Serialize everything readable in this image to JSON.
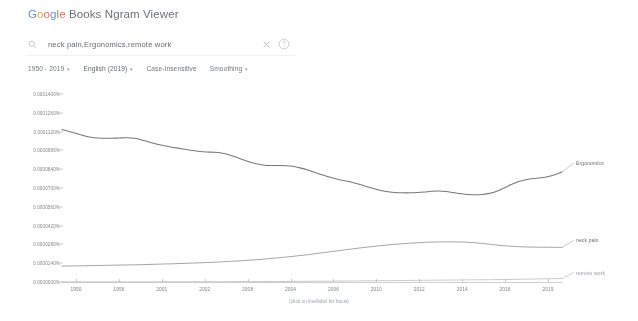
{
  "app": {
    "brand_parts": [
      "G",
      "o",
      "o",
      "g",
      "l",
      "e"
    ],
    "title_rest": " Books Ngram Viewer"
  },
  "search": {
    "value": "neck pain,Ergonomics,remote work",
    "placeholder": "Search in Google Books",
    "search_icon": "search-icon",
    "clear_icon": "close-icon",
    "help_icon": "help-circle-icon"
  },
  "controls": {
    "year_range": "1950 - 2019",
    "corpus": "English (2019)",
    "case_insensitive": "Case-Insensitive",
    "smoothing": "Smoothing",
    "caret": "▾"
  },
  "chart_data": {
    "type": "line",
    "title": "",
    "xlabel": "",
    "ylabel": "",
    "caption": "(click on line/label for focus)",
    "grid": false,
    "legend_position": "right-inline",
    "xlim": [
      1950,
      2019
    ],
    "ylim": [
      0.0,
      0.00014
    ],
    "ytick_labels": [
      "0.0001400%",
      "0.0001260%",
      "0.0001120%",
      "0.0000980%",
      "0.0000840%",
      "0.0000700%",
      "0.0000560%",
      "0.0000420%",
      "0.0000280%",
      "0.0000140%",
      "0.0000000%"
    ],
    "ytick_values": [
      0.00014,
      0.000126,
      0.000112,
      9.8e-05,
      8.4e-05,
      7e-05,
      5.6e-05,
      4.2e-05,
      2.8e-05,
      1.4e-05,
      0.0
    ],
    "xtick_labels": [
      "1950",
      "1956",
      "2001",
      "2002",
      "2008",
      "2004",
      "2006",
      "2010",
      "2012",
      "2014",
      "2016",
      "2019"
    ],
    "xtick_years": [
      1950,
      1956,
      2001,
      2002,
      2008,
      2004,
      2006,
      2010,
      2012,
      2014,
      2016,
      2019
    ],
    "series": [
      {
        "name": "Ergonomics",
        "color": "#5f6368",
        "label_x": 2019,
        "values": [
          0.0001135,
          0.000112,
          0.0001105,
          0.000109,
          0.0001078,
          0.0001072,
          0.000107,
          0.0001071,
          0.0001073,
          0.0001074,
          0.000107,
          0.0001058,
          0.0001042,
          0.0001028,
          0.0001016,
          0.0001006,
          9.97e-05,
          9.88e-05,
          9.79e-05,
          9.72e-05,
          9.68e-05,
          9.66e-05,
          9.6e-05,
          9.48e-05,
          9.3e-05,
          9.1e-05,
          8.92e-05,
          8.78e-05,
          8.7e-05,
          8.68e-05,
          8.68e-05,
          8.66e-05,
          8.6e-05,
          8.48e-05,
          8.32e-05,
          8.14e-05,
          7.96e-05,
          7.8e-05,
          7.66e-05,
          7.54e-05,
          7.42e-05,
          7.28e-05,
          7.12e-05,
          6.96e-05,
          6.82e-05,
          6.72e-05,
          6.66e-05,
          6.64e-05,
          6.64e-05,
          6.66e-05,
          6.7e-05,
          6.76e-05,
          6.78e-05,
          6.74e-05,
          6.66e-05,
          6.58e-05,
          6.52e-05,
          6.5e-05,
          6.52e-05,
          6.6e-05,
          6.76e-05,
          7e-05,
          7.26e-05,
          7.48e-05,
          7.62e-05,
          7.7e-05,
          7.76e-05,
          7.84e-05,
          7.98e-05,
          8.2e-05
        ]
      },
      {
        "name": "neck pain",
        "color": "#83888d",
        "label_x": 2019,
        "values": [
          1.18e-05,
          1.19e-05,
          1.2e-05,
          1.21e-05,
          1.22e-05,
          1.23e-05,
          1.24e-05,
          1.25e-05,
          1.26e-05,
          1.27e-05,
          1.28e-05,
          1.29e-05,
          1.31e-05,
          1.32e-05,
          1.34e-05,
          1.35e-05,
          1.37e-05,
          1.39e-05,
          1.41e-05,
          1.43e-05,
          1.45e-05,
          1.47e-05,
          1.5e-05,
          1.53e-05,
          1.56e-05,
          1.59e-05,
          1.63e-05,
          1.67e-05,
          1.71e-05,
          1.76e-05,
          1.81e-05,
          1.86e-05,
          1.92e-05,
          1.98e-05,
          2.04e-05,
          2.11e-05,
          2.18e-05,
          2.25e-05,
          2.32e-05,
          2.39e-05,
          2.46e-05,
          2.53e-05,
          2.59e-05,
          2.65e-05,
          2.71e-05,
          2.76e-05,
          2.81e-05,
          2.85e-05,
          2.89e-05,
          2.92e-05,
          2.95e-05,
          2.97e-05,
          2.98e-05,
          2.99e-05,
          2.99e-05,
          2.98e-05,
          2.96e-05,
          2.92e-05,
          2.87e-05,
          2.81e-05,
          2.75e-05,
          2.7e-05,
          2.66e-05,
          2.63e-05,
          2.61e-05,
          2.6e-05,
          2.59e-05,
          2.59e-05,
          2.58e-05,
          2.58e-05
        ]
      },
      {
        "name": "remote work",
        "color": "#a8adb2",
        "label_x": 2019,
        "values": [
          1e-07,
          1e-07,
          1e-07,
          1e-07,
          1e-07,
          1e-07,
          1e-07,
          1e-07,
          1e-07,
          1e-07,
          1e-07,
          1e-07,
          1e-07,
          1e-07,
          2e-07,
          2e-07,
          2e-07,
          2e-07,
          2e-07,
          2e-07,
          2e-07,
          2e-07,
          2e-07,
          3e-07,
          3e-07,
          3e-07,
          3e-07,
          3e-07,
          4e-07,
          4e-07,
          4e-07,
          4e-07,
          5e-07,
          5e-07,
          5e-07,
          6e-07,
          6e-07,
          6e-07,
          7e-07,
          7e-07,
          8e-07,
          8e-07,
          9e-07,
          9e-07,
          1e-06,
          1e-06,
          1.1e-06,
          1.1e-06,
          1.2e-06,
          1.2e-06,
          1.3e-06,
          1.3e-06,
          1.4e-06,
          1.4e-06,
          1.5e-06,
          1.5e-06,
          1.6e-06,
          1.6e-06,
          1.7e-06,
          1.7e-06,
          1.8e-06,
          1.8e-06,
          1.9e-06,
          2e-06,
          2.1e-06,
          2.2e-06,
          2.3e-06,
          2.4e-06,
          2.5e-06,
          2.6e-06
        ]
      }
    ]
  }
}
